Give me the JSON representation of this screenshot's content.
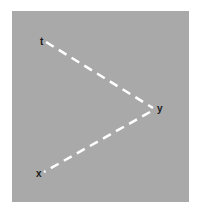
{
  "diagram": {
    "background_color": "#a9a9a9",
    "line_color": "#ffffff",
    "line_style": "dashed",
    "nodes": [
      {
        "id": "t",
        "label": "t",
        "x": 43,
        "y": 40
      },
      {
        "id": "y",
        "label": "y",
        "x": 155,
        "y": 107
      },
      {
        "id": "x",
        "label": "x",
        "x": 40,
        "y": 173
      }
    ],
    "edges": [
      {
        "from": "t",
        "to": "y"
      },
      {
        "from": "y",
        "to": "x"
      }
    ]
  }
}
